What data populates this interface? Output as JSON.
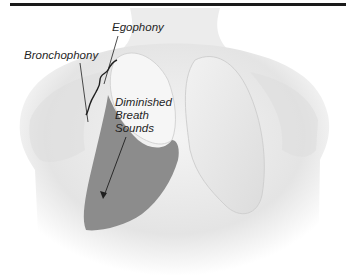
{
  "figure": {
    "labels": {
      "egophony": "Egophony",
      "bronchophony": "Bronchophony",
      "diminished": [
        "Diminished",
        "Breath",
        "Sounds"
      ]
    },
    "colors": {
      "skin_shade": "#d9d9d9",
      "lung_fill": "#ececec",
      "effusion_fill": "#8c8c8c",
      "text": "#1f1f1f",
      "rule": "#1a1a1a"
    }
  }
}
